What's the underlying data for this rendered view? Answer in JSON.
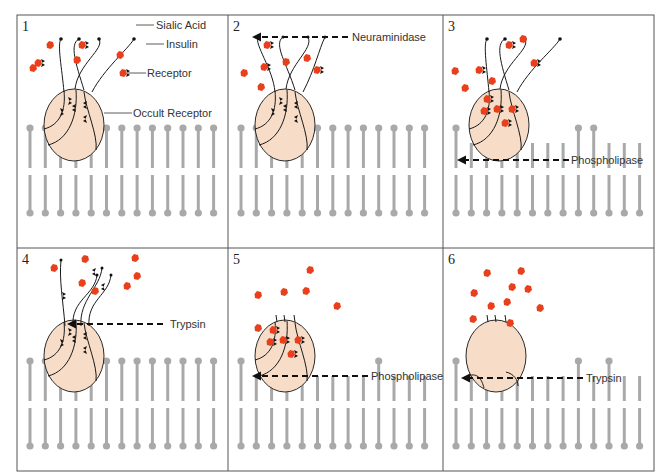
{
  "figure": {
    "colors": {
      "insulin": "#e8401c",
      "cell_fill": "#f7dcc8",
      "lipid": "#a9a9a9",
      "receptor": "#111111"
    }
  },
  "labels": {
    "sialic_acid": "Sialic Acid",
    "insulin": "Insulin",
    "receptor": "Receptor",
    "occult_receptor": "Occult Receptor"
  },
  "panels": [
    {
      "number": "1",
      "enzyme": ""
    },
    {
      "number": "2",
      "enzyme": "Neuraminidase"
    },
    {
      "number": "3",
      "enzyme": "Phospholipase"
    },
    {
      "number": "4",
      "enzyme": "Trypsin"
    },
    {
      "number": "5",
      "enzyme": "Phospholipase"
    },
    {
      "number": "6",
      "enzyme": "Trypsin"
    }
  ]
}
